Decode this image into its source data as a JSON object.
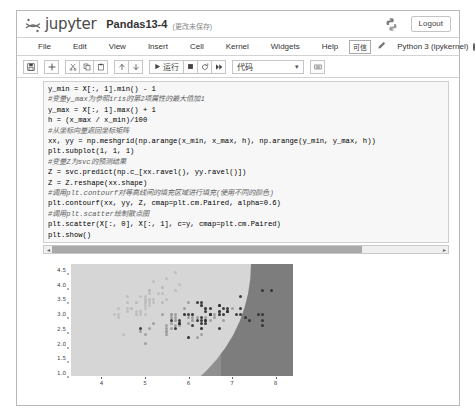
{
  "header": {
    "logo_icon": "jupyter-logo-icon",
    "wordmark": "jupyter",
    "notebook_name": "Pandas13-4",
    "save_status": "(更改未保存)",
    "python_icon": "python-logo-icon",
    "logout_label": "Logout"
  },
  "menubar": {
    "items": [
      {
        "label": "File"
      },
      {
        "label": "Edit"
      },
      {
        "label": "View"
      },
      {
        "label": "Insert"
      },
      {
        "label": "Cell"
      },
      {
        "label": "Kernel"
      },
      {
        "label": "Widgets"
      },
      {
        "label": "Help"
      }
    ],
    "trusted_label": "可信",
    "edit_icon": "pencil-icon",
    "kernel_label": "Python 3 (ipykernel)",
    "kernel_status_icon": "kernel-idle-circle-icon"
  },
  "toolbar": {
    "save_icon": "floppy-disk-icon",
    "add_icon": "plus-icon",
    "cut_icon": "scissors-icon",
    "copy_icon": "copy-icon",
    "paste_icon": "clipboard-paste-icon",
    "move_up_icon": "arrow-up-icon",
    "move_down_icon": "arrow-down-icon",
    "run_icon": "play-icon",
    "run_label": "运行",
    "stop_icon": "stop-square-icon",
    "restart_icon": "restart-circle-icon",
    "restart_run_all_icon": "fast-forward-icon",
    "cell_type_value": "代码",
    "cell_type_caret": "▾",
    "command_palette_icon": "keyboard-icon"
  },
  "notebook": {
    "cell": {
      "prompt": "",
      "code_lines": [
        {
          "text": "y_min = X[:, 1].min() - 1",
          "kind": "code"
        },
        {
          "text": "#变量y_max为参照iris的第2项属性的最大值加1",
          "kind": "comment"
        },
        {
          "text": "y_max = X[:, 1].max() + 1",
          "kind": "code"
        },
        {
          "text": "h = (x_max / x_min)/100",
          "kind": "code"
        },
        {
          "text": "#从坐标向量返回坐标矩阵",
          "kind": "comment"
        },
        {
          "text": "xx, yy = np.meshgrid(np.arange(x_min, x_max, h), np.arange(y_min, y_max, h))",
          "kind": "code"
        },
        {
          "text": "plt.subplot(1, 1, 1)",
          "kind": "code"
        },
        {
          "text": "#变量Z为svc的预测结果",
          "kind": "comment"
        },
        {
          "text": "Z = svc.predict(np.c_[xx.ravel(), yy.ravel()])",
          "kind": "code"
        },
        {
          "text": "Z = Z.reshape(xx.shape)",
          "kind": "code"
        },
        {
          "text": "#调用plt.contourf对等高线间的填充区域进行填充(使用不同的颜色)",
          "kind": "comment"
        },
        {
          "text": "plt.contourf(xx, yy, Z, cmap=plt.cm.Paired, alpha=0.6)",
          "kind": "code"
        },
        {
          "text": "#调用plt.scatter绘制散点图",
          "kind": "comment"
        },
        {
          "text": "plt.scatter(X[:, 0], X[:, 1], c=y, cmap=plt.cm.Paired)",
          "kind": "code"
        },
        {
          "text": "plt.show()",
          "kind": "code"
        }
      ],
      "scroll_left_arrow": "◂",
      "scroll_right_arrow": "▸"
    }
  },
  "chart_data": {
    "type": "scatter",
    "title": "",
    "xlabel": "",
    "ylabel": "",
    "xlim": [
      3.3,
      8.4
    ],
    "ylim": [
      0.9,
      4.7
    ],
    "xticks": [
      4,
      5,
      6,
      7,
      8
    ],
    "yticks": [
      1.0,
      1.5,
      2.0,
      2.5,
      3.0,
      3.5,
      4.0,
      4.5
    ],
    "grid": false,
    "legend": "none",
    "annotations": [
      "SVM decision regions filled with plt.contourf (cmap=Paired, alpha=0.6)"
    ],
    "regions": [
      {
        "name": "class-0-region",
        "color": "#d6d6d6",
        "position": "upper-left"
      },
      {
        "name": "class-1-region",
        "color": "#8f8f8f",
        "position": "lower-middle"
      },
      {
        "name": "class-2-region",
        "color": "#7d7d7d",
        "position": "right"
      }
    ],
    "series": [
      {
        "name": "class-0",
        "color": "#bdbdbd",
        "points": [
          [
            5.1,
            3.5
          ],
          [
            4.9,
            3.0
          ],
          [
            4.7,
            3.2
          ],
          [
            4.6,
            3.1
          ],
          [
            5.0,
            3.6
          ],
          [
            5.4,
            3.9
          ],
          [
            4.6,
            3.4
          ],
          [
            5.0,
            3.4
          ],
          [
            4.4,
            2.9
          ],
          [
            4.9,
            3.1
          ],
          [
            5.4,
            3.7
          ],
          [
            4.8,
            3.4
          ],
          [
            4.8,
            3.0
          ],
          [
            4.3,
            3.0
          ],
          [
            5.8,
            4.0
          ],
          [
            5.7,
            4.4
          ],
          [
            5.4,
            3.9
          ],
          [
            5.1,
            3.5
          ],
          [
            5.7,
            3.8
          ],
          [
            5.1,
            3.8
          ],
          [
            5.4,
            3.4
          ],
          [
            5.1,
            3.7
          ],
          [
            4.6,
            3.6
          ],
          [
            5.1,
            3.3
          ],
          [
            4.8,
            3.4
          ],
          [
            5.0,
            3.0
          ],
          [
            5.0,
            3.4
          ],
          [
            5.2,
            3.5
          ],
          [
            5.2,
            3.4
          ],
          [
            4.7,
            3.2
          ],
          [
            4.8,
            3.1
          ],
          [
            5.4,
            3.4
          ],
          [
            5.2,
            4.1
          ],
          [
            5.5,
            4.2
          ],
          [
            4.9,
            3.1
          ],
          [
            5.0,
            3.2
          ],
          [
            5.5,
            3.5
          ],
          [
            4.9,
            3.6
          ],
          [
            4.4,
            3.0
          ],
          [
            5.1,
            3.4
          ],
          [
            5.0,
            3.5
          ],
          [
            4.5,
            2.3
          ],
          [
            4.4,
            3.2
          ],
          [
            5.0,
            3.5
          ],
          [
            5.1,
            3.8
          ],
          [
            4.8,
            3.0
          ],
          [
            5.1,
            3.8
          ],
          [
            4.6,
            3.2
          ],
          [
            5.3,
            3.7
          ],
          [
            5.0,
            3.3
          ]
        ]
      },
      {
        "name": "class-1",
        "color": "#9a9a9a",
        "points": [
          [
            7.0,
            3.2
          ],
          [
            6.4,
            3.2
          ],
          [
            6.9,
            3.1
          ],
          [
            5.5,
            2.3
          ],
          [
            6.5,
            2.8
          ],
          [
            5.7,
            2.8
          ],
          [
            6.3,
            3.3
          ],
          [
            4.9,
            2.4
          ],
          [
            6.6,
            2.9
          ],
          [
            5.2,
            2.7
          ],
          [
            5.0,
            2.0
          ],
          [
            5.9,
            3.0
          ],
          [
            6.0,
            2.2
          ],
          [
            6.1,
            2.9
          ],
          [
            5.6,
            2.9
          ],
          [
            6.7,
            3.1
          ],
          [
            5.6,
            3.0
          ],
          [
            5.8,
            2.7
          ],
          [
            6.2,
            2.2
          ],
          [
            5.6,
            2.5
          ],
          [
            5.9,
            3.2
          ],
          [
            6.1,
            2.8
          ],
          [
            6.3,
            2.5
          ],
          [
            6.1,
            2.8
          ],
          [
            6.4,
            2.9
          ],
          [
            6.6,
            3.0
          ],
          [
            6.8,
            2.8
          ],
          [
            6.7,
            3.0
          ],
          [
            6.0,
            2.9
          ],
          [
            5.7,
            2.6
          ],
          [
            5.5,
            2.4
          ],
          [
            5.5,
            2.4
          ],
          [
            5.8,
            2.7
          ],
          [
            6.0,
            2.7
          ],
          [
            5.4,
            3.0
          ],
          [
            6.0,
            3.4
          ],
          [
            6.7,
            3.1
          ],
          [
            6.3,
            2.3
          ],
          [
            5.6,
            3.0
          ],
          [
            5.5,
            2.5
          ],
          [
            5.5,
            2.6
          ],
          [
            6.1,
            3.0
          ],
          [
            5.8,
            2.6
          ],
          [
            5.0,
            2.3
          ],
          [
            5.6,
            2.7
          ],
          [
            5.7,
            3.0
          ],
          [
            5.7,
            2.9
          ],
          [
            6.2,
            2.9
          ],
          [
            5.1,
            2.5
          ],
          [
            5.7,
            2.8
          ]
        ]
      },
      {
        "name": "class-2",
        "color": "#303030",
        "points": [
          [
            6.3,
            3.3
          ],
          [
            5.8,
            2.7
          ],
          [
            7.1,
            3.0
          ],
          [
            6.3,
            2.9
          ],
          [
            6.5,
            3.0
          ],
          [
            7.6,
            3.0
          ],
          [
            4.9,
            2.5
          ],
          [
            7.3,
            2.9
          ],
          [
            6.7,
            2.5
          ],
          [
            7.2,
            3.6
          ],
          [
            6.5,
            3.2
          ],
          [
            6.4,
            2.7
          ],
          [
            6.8,
            3.0
          ],
          [
            5.7,
            2.5
          ],
          [
            5.8,
            2.8
          ],
          [
            6.4,
            3.2
          ],
          [
            6.5,
            3.0
          ],
          [
            7.7,
            3.8
          ],
          [
            7.7,
            2.6
          ],
          [
            6.0,
            2.2
          ],
          [
            6.9,
            3.2
          ],
          [
            5.6,
            2.8
          ],
          [
            7.7,
            2.8
          ],
          [
            6.3,
            2.7
          ],
          [
            6.7,
            3.3
          ],
          [
            7.2,
            3.2
          ],
          [
            6.2,
            2.8
          ],
          [
            6.1,
            3.0
          ],
          [
            6.4,
            2.8
          ],
          [
            7.2,
            3.0
          ],
          [
            7.4,
            2.8
          ],
          [
            7.9,
            3.8
          ],
          [
            6.4,
            2.8
          ],
          [
            6.3,
            2.8
          ],
          [
            6.1,
            2.6
          ],
          [
            7.7,
            3.0
          ],
          [
            6.3,
            3.4
          ],
          [
            6.4,
            3.1
          ],
          [
            6.0,
            3.0
          ],
          [
            6.9,
            3.1
          ],
          [
            6.7,
            3.1
          ],
          [
            6.9,
            3.1
          ],
          [
            5.8,
            2.7
          ],
          [
            6.8,
            3.2
          ],
          [
            6.7,
            3.3
          ],
          [
            6.7,
            3.0
          ],
          [
            6.3,
            2.5
          ],
          [
            6.5,
            3.0
          ],
          [
            6.2,
            3.4
          ],
          [
            5.9,
            3.0
          ]
        ]
      }
    ]
  }
}
